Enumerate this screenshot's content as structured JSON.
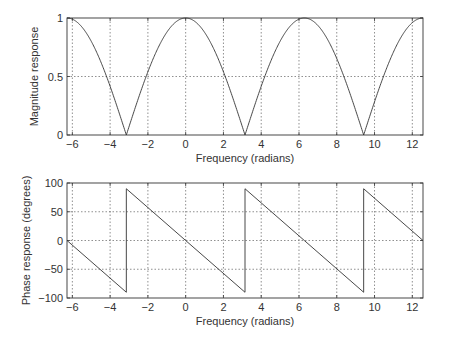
{
  "chart_data": [
    {
      "type": "line",
      "title": "",
      "xlabel": "Frequency (radians)",
      "ylabel": "Magnitude response",
      "xlim": [
        -6.2832,
        12.5664
      ],
      "ylim": [
        0,
        1
      ],
      "xticks": [
        -6,
        -4,
        -2,
        0,
        2,
        4,
        6,
        8,
        10,
        12
      ],
      "xtick_labels": [
        "−6",
        "−4",
        "−2",
        "0",
        "2",
        "4",
        "6",
        "8",
        "10",
        "12"
      ],
      "yticks": [
        0,
        0.5,
        1
      ],
      "ytick_labels": [
        "0",
        "0.5",
        "1"
      ],
      "grid": true,
      "function": "|cos(w/2)|",
      "series": [
        {
          "name": "magnitude",
          "x": [
            -6.2832,
            -5.5,
            -4.712,
            -4.0,
            -3.1416,
            -2.0,
            -1.5708,
            0,
            1.5708,
            2.0,
            3.1416,
            4.0,
            4.712,
            6.2832,
            7.854,
            8.0,
            9.4248,
            10.0,
            10.996,
            12.5664
          ],
          "values": [
            1.0,
            0.92,
            0.707,
            0.42,
            0.0,
            0.54,
            0.707,
            1.0,
            0.707,
            0.54,
            0.0,
            0.42,
            0.707,
            1.0,
            0.707,
            0.65,
            0.0,
            0.29,
            0.707,
            1.0
          ]
        }
      ]
    },
    {
      "type": "line",
      "title": "",
      "xlabel": "Frequency (radians)",
      "ylabel": "Phase response (degrees)",
      "xlim": [
        -6.2832,
        12.5664
      ],
      "ylim": [
        -100,
        100
      ],
      "xticks": [
        -6,
        -4,
        -2,
        0,
        2,
        4,
        6,
        8,
        10,
        12
      ],
      "xtick_labels": [
        "−6",
        "−4",
        "−2",
        "0",
        "2",
        "4",
        "6",
        "8",
        "10",
        "12"
      ],
      "yticks": [
        -100,
        -50,
        0,
        50,
        100
      ],
      "ytick_labels": [
        "−100",
        "−50",
        "0",
        "50",
        "100"
      ],
      "grid": true,
      "function": "sawtooth phase, -w/2 in degrees wrapped to [-90, 90]",
      "series": [
        {
          "name": "phase",
          "x": [
            -6.2832,
            -3.1416,
            -3.1416,
            0,
            3.1416,
            3.1416,
            6.2832,
            9.4248,
            9.4248,
            12.5664
          ],
          "values": [
            0,
            -90,
            90,
            0,
            -90,
            90,
            0,
            -90,
            90,
            0
          ]
        }
      ]
    }
  ]
}
